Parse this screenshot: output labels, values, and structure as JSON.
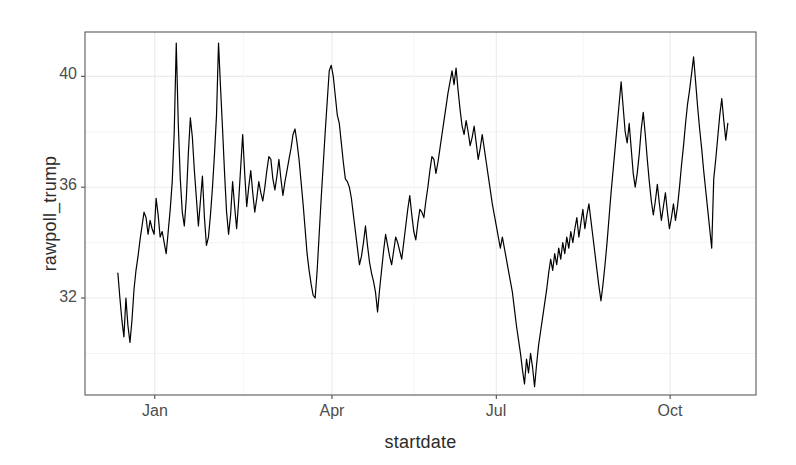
{
  "chart_data": {
    "type": "line",
    "title": "",
    "xlabel": "startdate",
    "ylabel": "rawpoll_trump",
    "grid": true,
    "legend": false,
    "xlim": [
      0,
      1
    ],
    "ylim": [
      28.5,
      41.6
    ],
    "yticks": [
      32,
      36,
      40
    ],
    "ytick_labels": [
      "32",
      "36",
      "40"
    ],
    "xticks": [
      0.104,
      0.368,
      0.613,
      0.872
    ],
    "xtick_labels": [
      "Jan",
      "Apr",
      "Jul",
      "Oct"
    ],
    "series": [
      {
        "name": "rawpoll_trump",
        "color": "#000000",
        "linewidth": 1.2,
        "x": [
          0.049,
          0.052,
          0.055,
          0.058,
          0.061,
          0.064,
          0.067,
          0.07,
          0.073,
          0.076,
          0.079,
          0.082,
          0.085,
          0.088,
          0.091,
          0.094,
          0.097,
          0.1,
          0.103,
          0.106,
          0.109,
          0.112,
          0.115,
          0.118,
          0.121,
          0.124,
          0.127,
          0.13,
          0.133,
          0.136,
          0.139,
          0.142,
          0.145,
          0.148,
          0.151,
          0.154,
          0.157,
          0.16,
          0.163,
          0.166,
          0.169,
          0.172,
          0.175,
          0.178,
          0.181,
          0.184,
          0.187,
          0.19,
          0.193,
          0.196,
          0.199,
          0.202,
          0.205,
          0.208,
          0.211,
          0.214,
          0.217,
          0.22,
          0.223,
          0.226,
          0.229,
          0.232,
          0.235,
          0.238,
          0.241,
          0.244,
          0.247,
          0.25,
          0.253,
          0.256,
          0.259,
          0.262,
          0.265,
          0.268,
          0.271,
          0.274,
          0.277,
          0.28,
          0.283,
          0.286,
          0.289,
          0.292,
          0.295,
          0.298,
          0.301,
          0.304,
          0.307,
          0.31,
          0.313,
          0.316,
          0.319,
          0.322,
          0.325,
          0.328,
          0.331,
          0.334,
          0.337,
          0.34,
          0.343,
          0.346,
          0.349,
          0.352,
          0.355,
          0.358,
          0.361,
          0.364,
          0.367,
          0.37,
          0.373,
          0.376,
          0.379,
          0.382,
          0.385,
          0.388,
          0.391,
          0.394,
          0.397,
          0.4,
          0.403,
          0.406,
          0.409,
          0.412,
          0.415,
          0.418,
          0.421,
          0.424,
          0.427,
          0.43,
          0.433,
          0.436,
          0.439,
          0.442,
          0.445,
          0.448,
          0.451,
          0.454,
          0.457,
          0.46,
          0.463,
          0.466,
          0.469,
          0.472,
          0.475,
          0.478,
          0.481,
          0.484,
          0.487,
          0.49,
          0.493,
          0.496,
          0.499,
          0.502,
          0.505,
          0.508,
          0.511,
          0.514,
          0.517,
          0.52,
          0.523,
          0.526,
          0.529,
          0.532,
          0.535,
          0.538,
          0.541,
          0.544,
          0.547,
          0.55,
          0.553,
          0.556,
          0.559,
          0.562,
          0.565,
          0.568,
          0.571,
          0.574,
          0.577,
          0.58,
          0.583,
          0.586,
          0.589,
          0.592,
          0.595,
          0.598,
          0.601,
          0.604,
          0.607,
          0.61,
          0.613,
          0.616,
          0.619,
          0.622,
          0.625,
          0.628,
          0.631,
          0.634,
          0.637,
          0.64,
          0.643,
          0.646,
          0.649,
          0.652,
          0.655,
          0.658,
          0.661,
          0.664,
          0.667,
          0.67,
          0.673,
          0.676,
          0.679,
          0.682,
          0.685,
          0.688,
          0.691,
          0.694,
          0.697,
          0.7,
          0.703,
          0.706,
          0.709,
          0.712,
          0.715,
          0.718,
          0.721,
          0.724,
          0.727,
          0.73,
          0.733,
          0.736,
          0.739,
          0.742,
          0.745,
          0.748,
          0.751,
          0.754,
          0.757,
          0.76,
          0.763,
          0.766,
          0.769,
          0.772,
          0.775,
          0.778,
          0.781,
          0.784,
          0.787,
          0.79,
          0.793,
          0.796,
          0.799,
          0.802,
          0.805,
          0.808,
          0.811,
          0.814,
          0.817,
          0.82,
          0.823,
          0.826,
          0.829,
          0.832,
          0.835,
          0.838,
          0.841,
          0.844,
          0.847,
          0.85,
          0.853,
          0.856,
          0.859,
          0.862,
          0.865,
          0.868,
          0.871,
          0.874,
          0.877,
          0.88,
          0.883,
          0.886,
          0.889,
          0.892,
          0.895,
          0.898,
          0.901,
          0.904,
          0.907,
          0.91,
          0.913,
          0.916,
          0.919,
          0.922,
          0.925,
          0.928,
          0.931,
          0.934,
          0.937,
          0.94,
          0.943,
          0.946,
          0.949,
          0.952,
          0.955,
          0.958
        ],
        "y": [
          32.9,
          32.0,
          31.2,
          30.6,
          32.0,
          31.0,
          30.4,
          31.2,
          32.3,
          33.0,
          33.5,
          34.1,
          34.6,
          35.1,
          34.9,
          34.3,
          34.8,
          34.5,
          34.3,
          35.6,
          35.0,
          34.2,
          34.4,
          34.0,
          33.6,
          34.4,
          35.2,
          36.2,
          38.0,
          41.2,
          38.3,
          36.3,
          35.1,
          34.6,
          35.6,
          37.2,
          38.5,
          37.8,
          36.6,
          35.6,
          34.6,
          35.5,
          36.4,
          34.9,
          33.9,
          34.2,
          35.0,
          36.0,
          37.2,
          38.6,
          41.2,
          39.6,
          38.1,
          36.5,
          35.1,
          34.3,
          35.0,
          36.2,
          35.3,
          34.5,
          35.5,
          36.7,
          37.9,
          36.5,
          35.3,
          36.0,
          36.6,
          35.8,
          35.1,
          35.6,
          36.2,
          35.8,
          35.5,
          36.0,
          36.6,
          37.1,
          37.0,
          36.3,
          35.9,
          36.4,
          37.0,
          36.3,
          35.7,
          36.2,
          36.6,
          37.0,
          37.4,
          37.9,
          38.1,
          37.6,
          37.0,
          36.2,
          35.4,
          34.5,
          33.6,
          33.0,
          32.5,
          32.1,
          32.0,
          33.0,
          34.3,
          35.6,
          36.8,
          38.0,
          39.1,
          40.2,
          40.4,
          40.0,
          39.3,
          38.6,
          38.3,
          37.6,
          36.9,
          36.3,
          36.2,
          36.0,
          35.6,
          35.0,
          34.4,
          33.8,
          33.2,
          33.5,
          34.0,
          34.6,
          33.9,
          33.3,
          32.9,
          32.6,
          32.2,
          31.5,
          32.3,
          33.0,
          33.7,
          34.3,
          33.9,
          33.5,
          33.2,
          33.7,
          34.2,
          34.0,
          33.7,
          33.4,
          34.0,
          34.6,
          35.2,
          35.7,
          35.0,
          34.4,
          34.1,
          34.7,
          35.2,
          35.1,
          34.9,
          35.5,
          36.0,
          36.6,
          37.1,
          37.0,
          36.5,
          36.9,
          37.4,
          37.9,
          38.4,
          38.9,
          39.4,
          39.8,
          40.2,
          39.7,
          40.3,
          39.5,
          38.8,
          38.2,
          37.9,
          38.4,
          38.0,
          37.5,
          37.8,
          38.2,
          37.6,
          37.0,
          37.4,
          37.9,
          37.4,
          36.9,
          36.4,
          35.9,
          35.4,
          35.0,
          34.6,
          34.2,
          33.8,
          34.2,
          33.8,
          33.4,
          33.0,
          32.6,
          32.2,
          31.6,
          31.0,
          30.5,
          30.0,
          29.4,
          28.9,
          29.8,
          29.3,
          30.0,
          29.5,
          28.8,
          29.6,
          30.3,
          30.8,
          31.3,
          31.8,
          32.3,
          32.9,
          33.4,
          33.0,
          33.6,
          33.2,
          33.8,
          33.4,
          34.0,
          33.6,
          34.2,
          33.8,
          34.4,
          34.0,
          34.5,
          34.9,
          34.2,
          34.7,
          35.2,
          34.5,
          35.0,
          35.4,
          34.8,
          34.2,
          33.6,
          33.0,
          32.4,
          31.9,
          32.5,
          33.2,
          34.0,
          34.9,
          35.8,
          36.6,
          37.4,
          38.2,
          39.0,
          39.8,
          38.9,
          38.0,
          37.6,
          38.3,
          37.4,
          36.5,
          36.0,
          36.5,
          37.2,
          38.1,
          38.7,
          37.9,
          37.0,
          36.2,
          35.5,
          35.0,
          35.5,
          36.1,
          35.4,
          34.8,
          35.3,
          35.8,
          35.1,
          34.5,
          34.9,
          35.4,
          34.8,
          35.3,
          36.0,
          36.8,
          37.5,
          38.3,
          39.0,
          39.5,
          40.1,
          40.7,
          39.8,
          38.9,
          38.1,
          37.4,
          36.6,
          35.9,
          35.2,
          34.5,
          33.8,
          36.3,
          37.0,
          37.8,
          38.6,
          39.2,
          38.4,
          37.7,
          38.3
        ],
        "y_notes": "Noisy daily polling-average trace; min ~28.8 near early July, max ~41.2 in early January"
      }
    ],
    "extra_detail": {
      "panel_background": "#ffffff",
      "panel_border_color": "#4d4d4d",
      "gridline_color": "#ebebeb",
      "axis_text_color": "#4d4d4d",
      "axis_title_color": "#2b2b2b"
    }
  },
  "axis": {
    "y_title": "rawpoll_trump",
    "x_title": "startdate",
    "y_labels": [
      "40",
      "36",
      "32"
    ],
    "x_labels": [
      "Jan",
      "Apr",
      "Jul",
      "Oct"
    ]
  }
}
